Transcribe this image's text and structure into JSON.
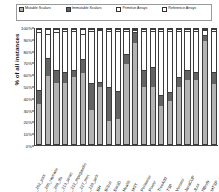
{
  "legend": {
    "items": [
      {
        "label": "Mutable Scalars",
        "swatch": "#b3b3b3",
        "icon": "legend-swatch-icon"
      },
      {
        "label": "Immutable Scalars",
        "swatch": "#636363",
        "icon": "legend-swatch-icon"
      },
      {
        "label": "Primitive Arrays",
        "swatch": "#ffffff",
        "icon": "legend-swatch-icon"
      },
      {
        "label": "Reference Arrays",
        "swatch": "#ffffff",
        "icon": "legend-swatch-icon"
      }
    ]
  },
  "chart_data": {
    "type": "bar",
    "subtype": "stacked-100-percent",
    "title": "",
    "xlabel": "",
    "ylabel": "% of all instances",
    "ylim": [
      0,
      100
    ],
    "yticks": [
      "0%",
      "10%",
      "20%",
      "30%",
      "40%",
      "50%",
      "60%",
      "70%",
      "80%",
      "90%",
      "100%"
    ],
    "grid": false,
    "legend_position": "top",
    "colors": {
      "mutable_scalars": "#b3b3b3",
      "immutable_scalars": "#636363",
      "primitive_arrays": "#ffffff",
      "reference_arrays": "#ffffff"
    },
    "categories": [
      "_202_jess",
      "_205_raytrace",
      "_209_db",
      "_213_javac",
      "_222_mpegaudio",
      "_227_mtrt",
      "_228_jack",
      "BH",
      "BiSort",
      "Em3D",
      "Health",
      "MST",
      "Perimeter",
      "Power",
      "TreeAdd",
      "TSP",
      "Voronoi",
      "JavaCUP",
      "JLex",
      "NBody",
      "MTSP"
    ],
    "series": [
      {
        "name": "Mutable Scalars",
        "values": [
          35,
          59,
          53,
          53,
          58,
          62,
          30,
          50,
          20,
          22,
          70,
          88,
          50,
          50,
          33,
          37,
          50,
          56,
          56,
          90,
          52
        ]
      },
      {
        "name": "Immutable Scalars",
        "values": [
          12,
          16,
          11,
          10,
          6,
          12,
          23,
          4,
          30,
          24,
          8,
          9,
          14,
          17,
          10,
          8,
          8,
          8,
          7,
          5,
          11
        ]
      },
      {
        "name": "Primitive Arrays",
        "values": [
          50,
          21,
          33,
          35,
          34,
          22,
          45,
          45,
          48,
          52,
          20,
          2,
          34,
          31,
          55,
          53,
          40,
          34,
          35,
          4,
          35
        ]
      },
      {
        "name": "Reference Arrays",
        "values": [
          3,
          4,
          3,
          2,
          2,
          4,
          2,
          1,
          2,
          2,
          2,
          1,
          2,
          2,
          2,
          2,
          2,
          2,
          2,
          1,
          2
        ]
      }
    ]
  }
}
